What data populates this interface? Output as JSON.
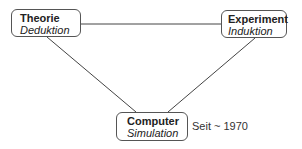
{
  "nodes": {
    "theorie": {
      "title": "Theorie",
      "subtitle": "Deduktion"
    },
    "experiment": {
      "title": "Experiment",
      "subtitle": "Induktion"
    },
    "computer": {
      "title": "Computer",
      "subtitle": "Simulation"
    }
  },
  "note": "Seit ~ 1970",
  "colors": {
    "line": "#444444",
    "border": "#555555"
  }
}
